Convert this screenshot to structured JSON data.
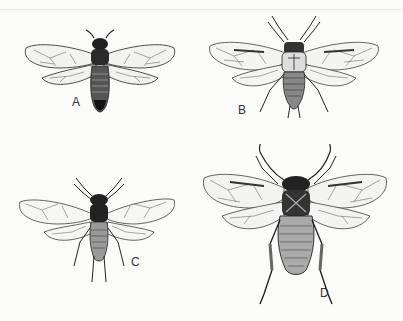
{
  "figure": {
    "background_color": "#fbfbfa",
    "ink_color": "#1a1a1a",
    "specimens": [
      {
        "label": "A",
        "position": "top-left"
      },
      {
        "label": "B",
        "position": "top-right"
      },
      {
        "label": "C",
        "position": "bottom-left"
      },
      {
        "label": "D",
        "position": "bottom-right"
      }
    ]
  }
}
